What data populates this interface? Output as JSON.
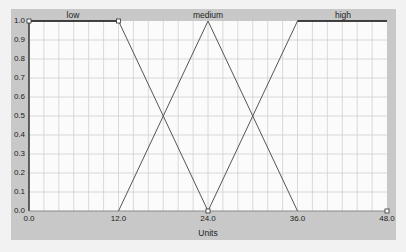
{
  "chart_data": {
    "type": "line",
    "title": "",
    "xlabel": "Units",
    "ylabel": "",
    "xlim": [
      0,
      48
    ],
    "ylim": [
      0,
      1
    ],
    "grid": true,
    "x_tick_labels": [
      "0.0",
      "12.0",
      "24.0",
      "36.0",
      "48.0"
    ],
    "x_ticks": [
      0,
      12,
      24,
      36,
      48
    ],
    "y_tick_labels": [
      "0.0",
      "0.1",
      "0.2",
      "0.3",
      "0.4",
      "0.5",
      "0.6",
      "0.7",
      "0.8",
      "0.9",
      "1.0"
    ],
    "legend_position": "top",
    "series": [
      {
        "name": "low",
        "x": [
          0,
          12,
          24
        ],
        "y": [
          1.0,
          1.0,
          0.0
        ]
      },
      {
        "name": "medium",
        "x": [
          12,
          24,
          36
        ],
        "y": [
          0.0,
          1.0,
          0.0
        ]
      },
      {
        "name": "high",
        "x": [
          24,
          36,
          48
        ],
        "y": [
          0.0,
          1.0,
          1.0
        ]
      }
    ],
    "set_labels": {
      "low": "low",
      "medium": "medium",
      "high": "high"
    }
  },
  "colors": {
    "panel": "#c8c8c8",
    "plot_bg": "#fbfbfb",
    "grid": "#d0d0d0",
    "line": "#555555",
    "page_bg": "#f2f2f2"
  }
}
